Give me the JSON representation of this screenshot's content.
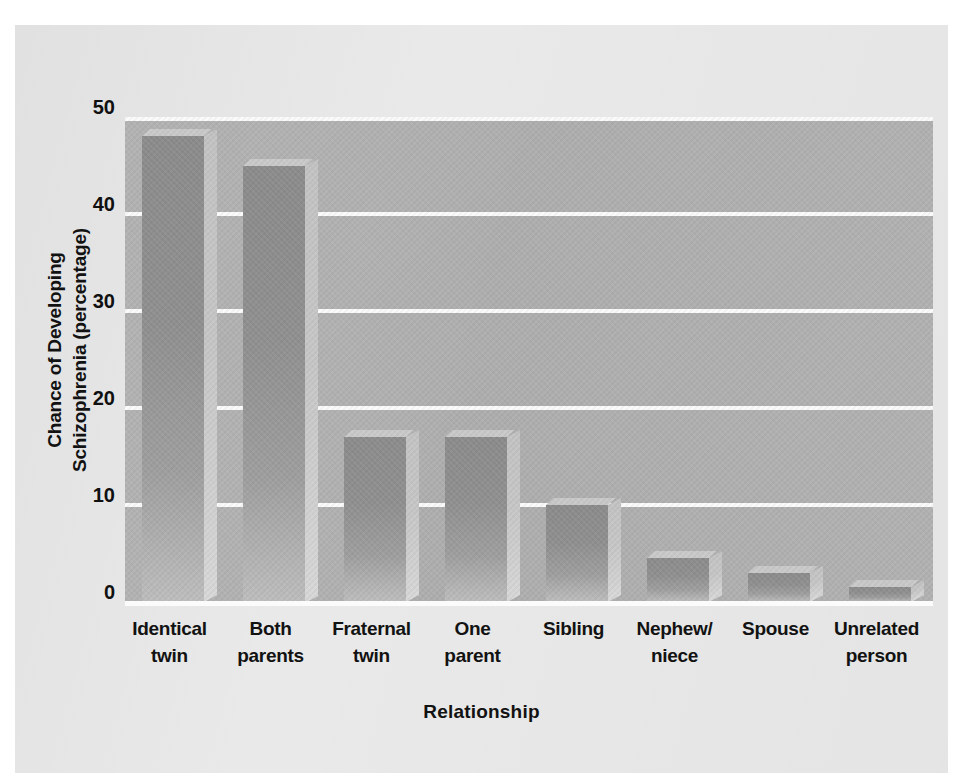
{
  "chart_data": {
    "type": "bar",
    "title": "",
    "xlabel": "Relationship",
    "ylabel": "Chance of Developing Schizophrenia (percentage)",
    "ylabel_line1": "Chance of Developing",
    "ylabel_line2": "Schizophrenia (percentage)",
    "categories": [
      "Identical twin",
      "Both parents",
      "Fraternal twin",
      "One parent",
      "Sibling",
      "Nephew/ niece",
      "Spouse",
      "Unrelated person"
    ],
    "category_lines": [
      [
        "Identical",
        "twin"
      ],
      [
        "Both",
        "parents"
      ],
      [
        "Fraternal",
        "twin"
      ],
      [
        "One",
        "parent"
      ],
      [
        "Sibling",
        ""
      ],
      [
        "Nephew/",
        "niece"
      ],
      [
        "Spouse",
        ""
      ],
      [
        "Unrelated",
        "person"
      ]
    ],
    "values": [
      48,
      45,
      17,
      17,
      10,
      4.5,
      3,
      1.5
    ],
    "ylim": [
      0,
      50
    ],
    "yticks": [
      0,
      10,
      20,
      30,
      40,
      50
    ],
    "ytick_labels": [
      "0",
      "10",
      "20",
      "30",
      "40",
      "50"
    ],
    "grid": true,
    "grid_color": "#fbfbfb",
    "legend": "none",
    "plot_background": "#b1b1b1",
    "figure_background": "#e9e9e9",
    "bar_color": "#929292",
    "bar_side_color": "#c8c8c8"
  }
}
